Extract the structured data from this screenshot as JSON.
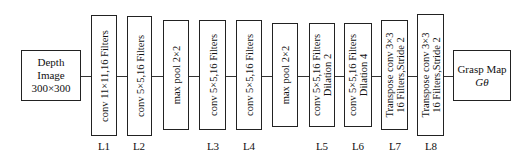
{
  "input": {
    "line1": "Depth",
    "line2": "Image",
    "line3": "300×300"
  },
  "layers": [
    {
      "line1": "conv 11×11,16 Filters",
      "line2": ""
    },
    {
      "line1": "conv 5×5,16 Filters",
      "line2": ""
    },
    {
      "line1": "max pool 2×2",
      "line2": ""
    },
    {
      "line1": "conv 5×5,16 Filters",
      "line2": ""
    },
    {
      "line1": "conv 5×5,16 Filters",
      "line2": ""
    },
    {
      "line1": "max pool 2×2",
      "line2": ""
    },
    {
      "line1": "conv 5×5,16 Filters",
      "line2": "Dilation 2"
    },
    {
      "line1": "conv 5×5,16 Filters",
      "line2": "Dilation 4"
    },
    {
      "line1": "Transpose conv 3×3",
      "line2": "16 Filters,Stride 2"
    },
    {
      "line1": "Transpose conv 3×3",
      "line2": "16 Filters,Stride 2"
    }
  ],
  "labels": [
    "L1",
    "L2",
    "L3",
    "L4",
    "L5",
    "L6",
    "L7",
    "L8"
  ],
  "output": {
    "line1": "Grasp Map",
    "line2": "Gθ"
  }
}
